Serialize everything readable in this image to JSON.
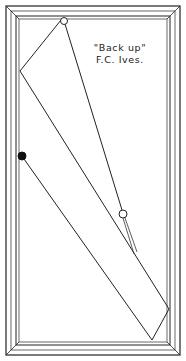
{
  "diagram": {
    "caption": {
      "title": "\"Back up\"",
      "author": "F.C. Ives."
    },
    "colors": {
      "line": "#222222",
      "background": "#ffffff"
    },
    "table": {
      "outer": [
        6,
        6,
        180,
        355
      ],
      "inner": [
        19,
        19,
        167,
        342
      ]
    },
    "balls": {
      "cue_ball": {
        "x": 64,
        "y": 21,
        "r": 3.5,
        "fill": "white"
      },
      "object_ball_black": {
        "x": 22,
        "y": 156,
        "r": 4,
        "fill": "black"
      },
      "object_ball_white": {
        "x": 123,
        "y": 214,
        "r": 4,
        "fill": "white"
      }
    },
    "path": [
      [
        64,
        21
      ],
      [
        20,
        71
      ],
      [
        169,
        309
      ],
      [
        152,
        340
      ],
      [
        22,
        156
      ]
    ]
  }
}
